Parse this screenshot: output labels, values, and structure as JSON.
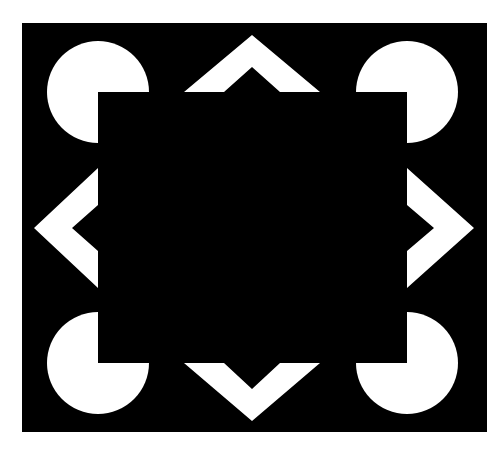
{
  "figure": {
    "colors": {
      "background": "#ffffff",
      "frame": "#000000",
      "shapes": "#ffffff",
      "occluder": "#000000"
    },
    "frame": {
      "x": 22,
      "y": 23,
      "width": 465,
      "height": 409
    },
    "occluder_square": {
      "x": 98,
      "y": 92,
      "width": 309,
      "height": 271
    },
    "pacmen": [
      {
        "name": "top-left",
        "cx": 98,
        "cy": 92,
        "r": 51
      },
      {
        "name": "top-right",
        "cx": 407,
        "cy": 92,
        "r": 51
      },
      {
        "name": "bottom-left",
        "cx": 98,
        "cy": 363,
        "r": 51
      },
      {
        "name": "bottom-right",
        "cx": 407,
        "cy": 363,
        "r": 51
      }
    ],
    "chevrons": [
      {
        "name": "top",
        "points": "252,35 320,92 280,92 252,67 224,92 184,92"
      },
      {
        "name": "left",
        "points": "34,228 98,168 98,205 72,228 98,251 98,288"
      },
      {
        "name": "right",
        "points": "474,228 407,168 407,205 434,228 407,251 407,288"
      },
      {
        "name": "bottom",
        "points": "252,421 320,363 280,363 252,389 224,363 184,363"
      }
    ]
  }
}
